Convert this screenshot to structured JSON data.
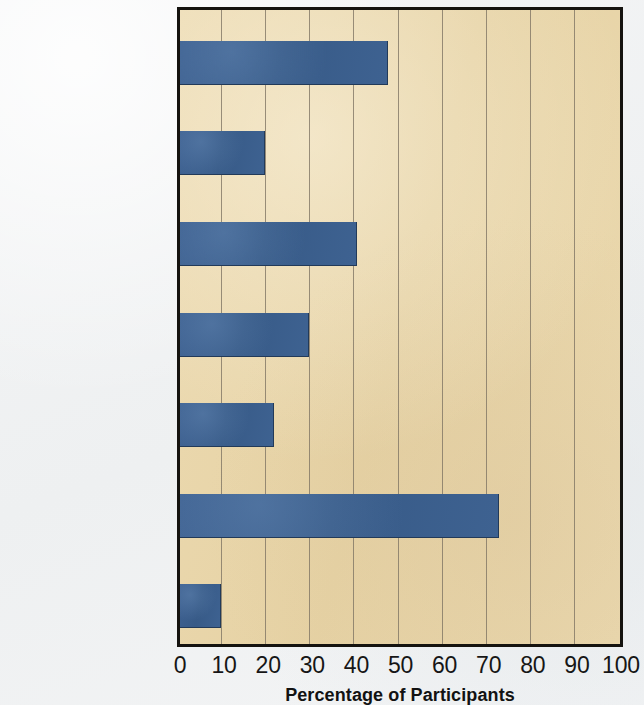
{
  "chart_data": {
    "type": "bar",
    "orientation": "horizontal",
    "title": "",
    "xlabel": "Percentage of Participants",
    "ylabel": "",
    "xlim": [
      0,
      100
    ],
    "xticks": [
      0,
      10,
      20,
      30,
      40,
      50,
      60,
      70,
      80,
      90,
      100
    ],
    "grid": "vertical",
    "legend": "none",
    "series_color": "#3a5f8f",
    "plot_background": "#e9d6ab",
    "axis_color": "#15130f",
    "categories": [
      "Run-down office building",
      "Ordinary person giving orders",
      "Teacher and learner in same room",
      "Teacher required to touch learner",
      "Experimenter giving orders by phone",
      "Teacher with fully obedient confederates",
      "Teacher with openly rebellious confederates"
    ],
    "category_lines": [
      [
        "Run-down",
        "office building"
      ],
      [
        "Ordinary",
        "person giving",
        "orders"
      ],
      [
        "Teacher",
        "and learner",
        "in same room"
      ],
      [
        "Teacher",
        "required to",
        "touch learner"
      ],
      [
        "Experimenter",
        "giving orders",
        "by phone"
      ],
      [
        "Teacher with",
        "fully obedient",
        "confederates"
      ],
      [
        "Teacher with",
        "openly rebellious",
        "confederates"
      ]
    ],
    "values": [
      47,
      19,
      40,
      29,
      21,
      72,
      9
    ]
  },
  "ticks": {
    "t0": "0",
    "t1": "10",
    "t2": "20",
    "t3": "30",
    "t4": "40",
    "t5": "50",
    "t6": "60",
    "t7": "70",
    "t8": "80",
    "t9": "90",
    "t10": "100"
  },
  "axis": {
    "x_title": "Percentage of Participants"
  }
}
